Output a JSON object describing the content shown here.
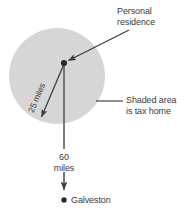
{
  "figure": {
    "labels": {
      "personal_residence_line1": "Personal",
      "personal_residence_line2": "residence",
      "shaded_area_line1": "Shaded area",
      "shaded_area_line2": "is tax home",
      "radius_label": "25 miles",
      "distance_line1": "60",
      "distance_line2": "miles",
      "city_label": "Galveston"
    },
    "colors": {
      "shaded_fill": "#d6d6d6",
      "ink": "#3b3b3b",
      "background": "#ffffff"
    },
    "geometry": {
      "circle_center_x": 57,
      "circle_center_y": 76,
      "circle_radius": 48,
      "residence_x": 64,
      "residence_y": 63,
      "galveston_x": 64,
      "galveston_y": 200
    }
  }
}
